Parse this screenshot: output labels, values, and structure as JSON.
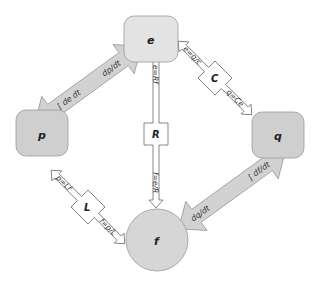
{
  "colors": {
    "node_light": "#e3e3e3",
    "node_dark": "#cfcfcf",
    "node_stroke": "#9a9a9a",
    "gray_arrow": "#d2d2d2",
    "gray_arrow_stroke": "#9a9a9a",
    "element_fill": "#ffffff",
    "element_stroke": "#6a6a6a"
  },
  "nodes": {
    "e": {
      "label": "e"
    },
    "p": {
      "label": "p"
    },
    "q": {
      "label": "q"
    },
    "f": {
      "label": "f"
    }
  },
  "relations": {
    "e_p": {
      "near_e": "dp/dt",
      "near_p": "∫ de dt"
    },
    "f_q": {
      "near_q": "∫ df/dt",
      "near_f": "dq/dt"
    }
  },
  "elements": {
    "R": {
      "label": "R",
      "eq_top": "e=Rf",
      "eq_bottom": "f=e/R"
    },
    "C": {
      "label": "C",
      "eq_top": "e=q/c",
      "eq_bottom": "q=Ce"
    },
    "L": {
      "label": "L",
      "eq_top": "p=Lf",
      "eq_bottom": "f=p/L"
    }
  }
}
